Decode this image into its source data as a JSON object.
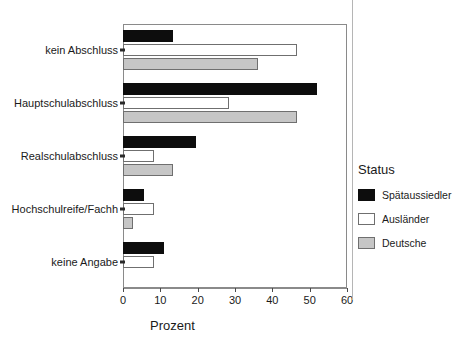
{
  "chart_data": {
    "type": "bar",
    "orientation": "horizontal",
    "title": "",
    "xlabel": "Prozent",
    "ylabel": "",
    "xlim": [
      0,
      60
    ],
    "xticks": [
      0,
      10,
      20,
      30,
      40,
      50,
      60
    ],
    "grid": false,
    "legend_position": "right",
    "legend_title": "Status",
    "categories": [
      "kein Abschluss",
      "Hauptschulabschluss",
      "Realschulabschluss",
      "Hochschulreife/Fachh",
      "keine Angabe"
    ],
    "series": [
      {
        "name": "Spätaussiedler",
        "color": "#0d0d0d",
        "values": [
          13.5,
          52.0,
          19.5,
          5.7,
          11.0
        ]
      },
      {
        "name": "Ausländer",
        "color": "#ffffff",
        "values": [
          46.5,
          28.5,
          8.3,
          8.3,
          8.3
        ]
      },
      {
        "name": "Deutsche",
        "color": "#c6c6c6",
        "values": [
          36.2,
          46.5,
          13.5,
          2.6,
          0.0
        ]
      }
    ]
  },
  "axis": {
    "tick_labels": [
      "0",
      "10",
      "20",
      "30",
      "40",
      "50",
      "60"
    ],
    "x_title": "Prozent"
  },
  "legend": {
    "title": "Status",
    "items": [
      {
        "label": "Spätaussiedler"
      },
      {
        "label": "Ausländer"
      },
      {
        "label": "Deutsche"
      }
    ]
  }
}
